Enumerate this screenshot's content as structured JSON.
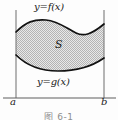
{
  "figure": {
    "kind": "area-between-two-curves",
    "caption": "图 6-1",
    "region_label": "S",
    "upper_curve_label": "y=f(x)",
    "lower_curve_label": "y=g(x)",
    "left_bound_label": "a",
    "right_bound_label": "b",
    "colors": {
      "curve": "#111111",
      "axis": "#6f6f6f",
      "fill": "#c9c9c9",
      "background": "#fdfdfd",
      "text": "#1a1a1a",
      "caption": "#8d8d8d"
    },
    "geometry": {
      "left_x": 16,
      "right_x": 104,
      "baseline_y": 98,
      "axis_top_y": 10,
      "upper_curve": "M16,32 C26,22 34,19 46,20 C58,21 66,28 76,33 C84,37 92,34 104,24",
      "lower_curve": "M16,55 C24,63 36,71 58,71 C78,71 94,65 104,58",
      "upper_left_y": 32,
      "upper_right_y": 24,
      "lower_left_y": 55,
      "lower_right_y": 58
    }
  }
}
